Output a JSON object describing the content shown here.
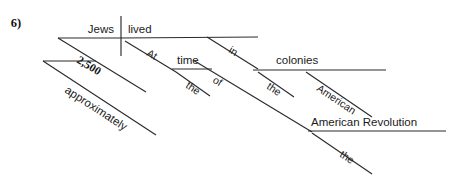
{
  "page": {
    "background_color": "#ffffff",
    "ink_color": "#2b2b2b",
    "item_number": "6)",
    "width": 461,
    "height": 178
  },
  "diagram": {
    "type": "sentence-diagram",
    "sentence": "Approximately 2,500 Jews lived at the time of the American colonies in the American Revolution",
    "subject": "Jews",
    "verb": "lived",
    "words": {
      "subject": "Jews",
      "verb": "lived",
      "subject_modifier_number": "2,500",
      "subject_modifier_adverb": "approximately",
      "prep_at": "At",
      "prep_at_object": "time",
      "article_the_1": "the",
      "prep_in": "in",
      "prep_in_object": "colonies",
      "prep_of": "of",
      "article_the_2": "the",
      "adjective_american": "American",
      "prep_in_object_2": "American Revolution",
      "article_the_3": "the"
    }
  },
  "labels": {
    "jews": "Jews",
    "lived": "lived",
    "n2500": "2,500",
    "approximately": "approximately",
    "at": "At",
    "time": "time",
    "the1": "the",
    "in": "in",
    "colonies": "colonies",
    "of": "of",
    "the2": "the",
    "american": "American",
    "american_revolution": "American Revolution",
    "the3": "the",
    "item_number": "6)"
  }
}
